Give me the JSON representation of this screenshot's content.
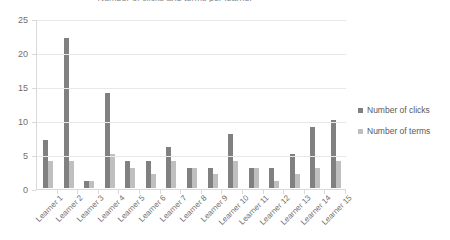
{
  "chart_data": {
    "type": "bar",
    "title": "Number of clicks and terms per learner",
    "xlabel": "",
    "ylabel": "",
    "ylim": [
      0,
      25
    ],
    "yticks": [
      0,
      5,
      10,
      15,
      20,
      25
    ],
    "grid": true,
    "legend_position": "right",
    "categories": [
      "Learner 1",
      "Learner 2",
      "Learner 3",
      "Learner 4",
      "Learner 5",
      "Learner 6",
      "Learner 7",
      "Learner 8",
      "Learner 9",
      "Learner 10",
      "Learner 11",
      "Learner 12",
      "Learner 13",
      "Learner 14",
      "Learner 15"
    ],
    "series": [
      {
        "name": "Number of clicks",
        "color": "#808080",
        "values": [
          7,
          22,
          1,
          14,
          4,
          4,
          6,
          3,
          3,
          8,
          3,
          3,
          5,
          9,
          10
        ]
      },
      {
        "name": "Number of terms",
        "color": "#bfbfbf",
        "values": [
          4,
          4,
          1,
          5,
          3,
          2,
          4,
          3,
          2,
          4,
          3,
          1,
          2,
          3,
          4
        ]
      }
    ]
  },
  "legend": {
    "items": [
      {
        "label": "Number of clicks"
      },
      {
        "label": "Number of terms"
      }
    ]
  }
}
